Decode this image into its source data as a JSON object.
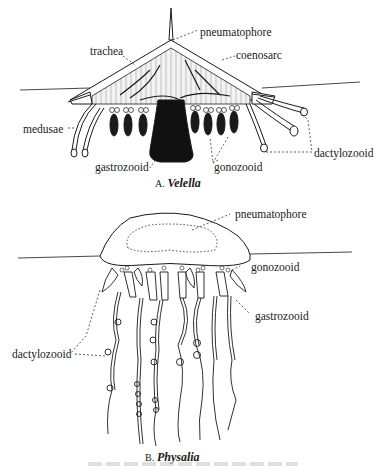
{
  "figure_a": {
    "letter": "A.",
    "name": "Velella",
    "labels": {
      "pneumatophore": "pneumatophore",
      "trachea": "trachea",
      "coenosarc": "coenosarc",
      "medusae": "medusae",
      "dactylozooid": "dactylozooid",
      "gastrozooid": "gastrozooid",
      "gonozooid": "gonozooid"
    }
  },
  "figure_b": {
    "letter": "B.",
    "name": "Physalia",
    "labels": {
      "pneumatophore": "pneumatophore",
      "gonozooid": "gonozooid",
      "gastrozooid": "gastrozooid",
      "dactylozooid": "dactylozooid"
    }
  },
  "colors": {
    "ink": "#1a1a1a",
    "paper": "#ffffff",
    "hatch": "#8a8a8a"
  }
}
